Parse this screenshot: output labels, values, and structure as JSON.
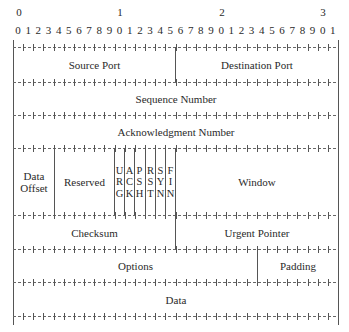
{
  "diagram": {
    "bit_width": 32,
    "header": {
      "tens": [
        "0",
        "1",
        "2",
        "3"
      ],
      "bits": [
        "0",
        "1",
        "2",
        "3",
        "4",
        "5",
        "6",
        "7",
        "8",
        "9",
        "0",
        "1",
        "2",
        "3",
        "4",
        "5",
        "6",
        "7",
        "8",
        "9",
        "0",
        "1",
        "2",
        "3",
        "4",
        "5",
        "6",
        "7",
        "8",
        "9",
        "0",
        "1"
      ]
    },
    "rows": [
      {
        "fields": [
          {
            "label": "Source Port",
            "start": 0,
            "bits": 16
          },
          {
            "label": "Destination Port",
            "start": 16,
            "bits": 16
          }
        ]
      },
      {
        "fields": [
          {
            "label": "Sequence Number",
            "start": 0,
            "bits": 32
          }
        ]
      },
      {
        "fields": [
          {
            "label": "Acknowledgment Number",
            "start": 0,
            "bits": 32
          }
        ]
      },
      {
        "fields": [
          {
            "label": "Data Offset",
            "start": 0,
            "bits": 4
          },
          {
            "label": "Reserved",
            "start": 4,
            "bits": 6
          },
          {
            "label": "URG",
            "start": 10,
            "bits": 1
          },
          {
            "label": "ACK",
            "start": 11,
            "bits": 1
          },
          {
            "label": "PSH",
            "start": 12,
            "bits": 1
          },
          {
            "label": "RST",
            "start": 13,
            "bits": 1
          },
          {
            "label": "SYN",
            "start": 14,
            "bits": 1
          },
          {
            "label": "FIN",
            "start": 15,
            "bits": 1
          },
          {
            "label": "Window",
            "start": 16,
            "bits": 16
          }
        ]
      },
      {
        "fields": [
          {
            "label": "Checksum",
            "start": 0,
            "bits": 16
          },
          {
            "label": "Urgent Pointer",
            "start": 16,
            "bits": 16
          }
        ]
      },
      {
        "fields": [
          {
            "label": "Options",
            "start": 0,
            "bits": 24
          },
          {
            "label": "Padding",
            "start": 24,
            "bits": 8
          }
        ]
      },
      {
        "fields": [
          {
            "label": "Data",
            "start": 0,
            "bits": 32
          }
        ]
      }
    ],
    "labels": {
      "source_port": "Source Port",
      "destination_port": "Destination Port",
      "sequence_number": "Sequence Number",
      "acknowledgment_number": "Acknowledgment Number",
      "data_offset_1": "Data",
      "data_offset_2": "Offset",
      "reserved": "Reserved",
      "flags": {
        "urg": [
          "U",
          "R",
          "G"
        ],
        "ack": [
          "A",
          "C",
          "K"
        ],
        "psh": [
          "P",
          "S",
          "H"
        ],
        "rst": [
          "R",
          "S",
          "T"
        ],
        "syn": [
          "S",
          "Y",
          "N"
        ],
        "fin": [
          "F",
          "I",
          "N"
        ]
      },
      "window": "Window",
      "checksum": "Checksum",
      "urgent_pointer": "Urgent Pointer",
      "options": "Options",
      "padding": "Padding",
      "data": "Data"
    }
  }
}
